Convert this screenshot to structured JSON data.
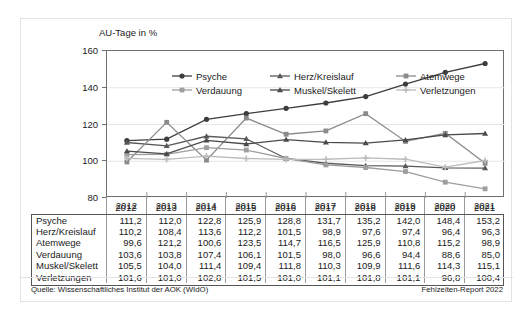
{
  "chart_data": {
    "type": "line",
    "title": "AU-Tage in %",
    "ylabel": "AU-Tage in %",
    "xlabel": "",
    "ylim": [
      80,
      160
    ],
    "yticks": [
      80,
      100,
      120,
      140,
      160
    ],
    "grid": true,
    "legend_position": "top-inside",
    "categories": [
      "2012",
      "2013",
      "2014",
      "2015",
      "2016",
      "2017",
      "2018",
      "2019",
      "2020",
      "2021"
    ],
    "series": [
      {
        "name": "Psyche",
        "marker": "circle",
        "color": "#3d3d3d",
        "values": [
          111.2,
          112.0,
          122.8,
          125.9,
          128.8,
          131.7,
          135.2,
          142.0,
          148.4,
          153.2
        ],
        "labels": [
          "111,2",
          "112,0",
          "122,8",
          "125,9",
          "128,8",
          "131,7",
          "135,2",
          "142,0",
          "148,4",
          "153,2"
        ]
      },
      {
        "name": "Herz/Kreislauf",
        "marker": "triangle",
        "color": "#595959",
        "values": [
          110.2,
          108.4,
          113.6,
          112.2,
          101.5,
          98.9,
          97.6,
          97.4,
          96.4,
          96.3
        ],
        "labels": [
          "110,2",
          "108,4",
          "113,6",
          "112,2",
          "101,5",
          "98,9",
          "97,6",
          "97,4",
          "96,4",
          "96,3"
        ]
      },
      {
        "name": "Atemwege",
        "marker": "square",
        "color": "#8a8a8a",
        "values": [
          99.6,
          121.2,
          100.6,
          123.5,
          114.7,
          116.5,
          125.9,
          110.8,
          115.2,
          98.9
        ],
        "labels": [
          "99,6",
          "121,2",
          "100,6",
          "123,5",
          "114,7",
          "116,5",
          "125,9",
          "110,8",
          "115,2",
          "98,9"
        ]
      },
      {
        "name": "Verdauung",
        "marker": "square",
        "color": "#9e9e9e",
        "values": [
          103.6,
          103.8,
          107.4,
          106.1,
          101.5,
          98.0,
          96.6,
          94.4,
          88.6,
          85.0
        ],
        "labels": [
          "103,6",
          "103,8",
          "107,4",
          "106,1",
          "101,5",
          "98,0",
          "96,6",
          "94,4",
          "88,6",
          "85,0"
        ]
      },
      {
        "name": "Muskel/Skelett",
        "marker": "triangle",
        "color": "#4a4a4a",
        "values": [
          105.5,
          104.0,
          111.4,
          109.4,
          111.8,
          110.3,
          109.9,
          111.6,
          114.3,
          115.1
        ],
        "labels": [
          "105,5",
          "104,0",
          "111,4",
          "109,4",
          "111,8",
          "110,3",
          "109,9",
          "111,6",
          "114,3",
          "115,1"
        ]
      },
      {
        "name": "Verletzungen",
        "marker": "plus",
        "color": "#bcbcbc",
        "values": [
          101.6,
          101.0,
          102.8,
          101.5,
          101.0,
          101.1,
          101.8,
          101.1,
          96.8,
          100.4
        ],
        "labels": [
          "101,6",
          "101,0",
          "102,8",
          "101,5",
          "101,0",
          "101,1",
          "101,8",
          "101,1",
          "96,8",
          "100,4"
        ]
      }
    ]
  },
  "table": {
    "corner_label": "",
    "columns": [
      "2012",
      "2013",
      "2014",
      "2015",
      "2016",
      "2017",
      "2018",
      "2019",
      "2020",
      "2021"
    ],
    "rows": [
      {
        "label": "Psyche",
        "values": [
          "111,2",
          "112,0",
          "122,8",
          "125,9",
          "128,8",
          "131,7",
          "135,2",
          "142,0",
          "148,4",
          "153,2"
        ]
      },
      {
        "label": "Herz/Kreislauf",
        "values": [
          "110,2",
          "108,4",
          "113,6",
          "112,2",
          "101,5",
          "98,9",
          "97,6",
          "97,4",
          "96,4",
          "96,3"
        ]
      },
      {
        "label": "Atemwege",
        "values": [
          "99,6",
          "121,2",
          "100,6",
          "123,5",
          "114,7",
          "116,5",
          "125,9",
          "110,8",
          "115,2",
          "98,9"
        ]
      },
      {
        "label": "Verdauung",
        "values": [
          "103,6",
          "103,8",
          "107,4",
          "106,1",
          "101,5",
          "98,0",
          "96,6",
          "94,4",
          "88,6",
          "85,0"
        ]
      },
      {
        "label": "Muskel/Skelett",
        "values": [
          "105,5",
          "104,0",
          "111,4",
          "109,4",
          "111,8",
          "110,3",
          "109,9",
          "111,6",
          "114,3",
          "115,1"
        ]
      },
      {
        "label": "Verletzungen",
        "values": [
          "101,6",
          "101,0",
          "102,8",
          "101,5",
          "101,0",
          "101,1",
          "101,8",
          "101,1",
          "96,8",
          "100,4"
        ]
      }
    ]
  },
  "footer": {
    "source": "Quelle: Wissenschaftliches Institut der AOK (WIdO)",
    "report": "Fehlzeiten-Report 2022"
  }
}
